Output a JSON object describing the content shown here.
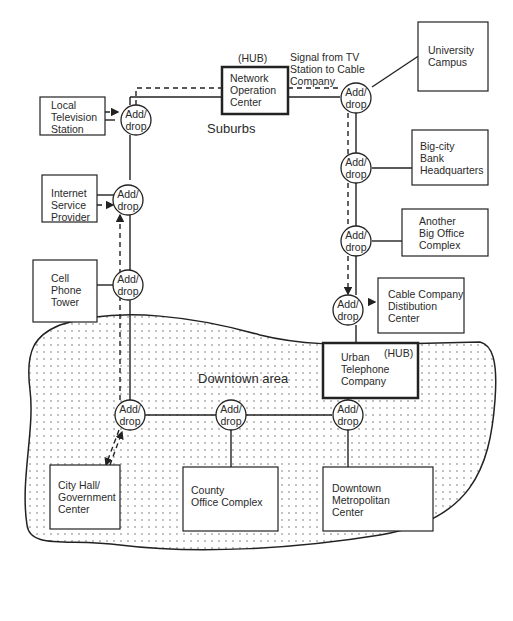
{
  "diagram": {
    "regions": {
      "suburbs": "Suburbs",
      "downtown": "Downtown area"
    },
    "hub_tag": "(HUB)",
    "add_drop": [
      "Add/",
      "drop"
    ],
    "signal_note": [
      "Signal from TV",
      "Station to Cable",
      "Company"
    ],
    "boxes": {
      "noc": [
        "Network",
        "Operation",
        "Center"
      ],
      "local_tv": [
        "Local",
        "Television",
        "Station"
      ],
      "isp": [
        "Internet",
        "Service",
        "Provider"
      ],
      "cell": [
        "Cell",
        "Phone",
        "Tower"
      ],
      "university": [
        "University",
        "Campus"
      ],
      "bank": [
        "Big-city",
        "Bank",
        "Headquarters"
      ],
      "office": [
        "Another",
        "Big Office",
        "Complex"
      ],
      "cable": [
        "Cable Company",
        "Distibution",
        "Center"
      ],
      "urban_tel": [
        "Urban",
        "Telephone",
        "Company"
      ],
      "city_hall": [
        "City Hall/",
        "Government",
        "Center"
      ],
      "county": [
        "County",
        "Office Complex"
      ],
      "downtown_metro": [
        "Downtown",
        "Metropolitan",
        "Center"
      ]
    }
  }
}
